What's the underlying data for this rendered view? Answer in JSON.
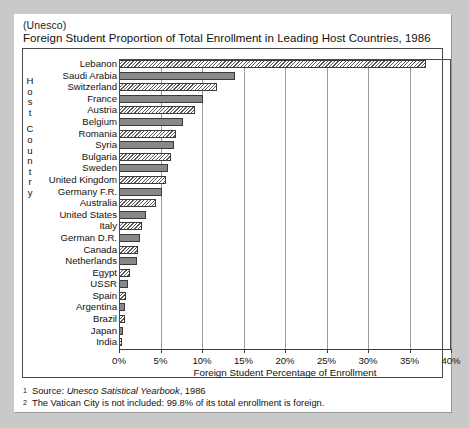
{
  "page": {
    "source_line": "(Unesco)",
    "title": "Foreign Student Proportion of Total Enrollment in Leading Host Countries, 1986"
  },
  "axis": {
    "y_label_letters": [
      "H",
      "o",
      "s",
      "t",
      "C",
      "o",
      "u",
      "n",
      "t",
      "r",
      "y"
    ],
    "y_label_text": "Host Country",
    "x_title": "Foreign Student Percentage of Enrollment",
    "x_ticks": [
      "0%",
      "5%",
      "10%",
      "15%",
      "20%",
      "25%",
      "30%",
      "35%",
      "40%"
    ]
  },
  "footnotes": [
    {
      "marker": "1",
      "prefix": "Source: ",
      "italic": "Unesco Satistical Yearbook",
      "suffix": ", 1986"
    },
    {
      "marker": "2",
      "prefix": "The Vatican City is not included:  99.8% of its total enrollment is foreign.",
      "italic": "",
      "suffix": ""
    }
  ],
  "chart_data": {
    "type": "bar",
    "orientation": "horizontal",
    "title": "Foreign Student Proportion of Total Enrollment in Leading Host Countries, 1986",
    "subtitle": "(Unesco)",
    "xlabel": "Foreign Student Percentage of Enrollment",
    "ylabel": "Host Country",
    "xlim": [
      0,
      40
    ],
    "xtick_step": 5,
    "grid": true,
    "legend": "none",
    "units": "percent",
    "categories": [
      "Lebanon",
      "Saudi Arabia",
      "Switzerland",
      "France",
      "Austria",
      "Belgium",
      "Romania",
      "Syria",
      "Bulgaria",
      "Sweden",
      "United Kingdom",
      "Germany F.R.",
      "Australia",
      "United States",
      "Italy",
      "German D.R.",
      "Canada",
      "Netherlands",
      "Egypt",
      "USSR",
      "Spain",
      "Argentina",
      "Brazil",
      "Japan",
      "India"
    ],
    "values": [
      37.0,
      14.0,
      11.8,
      10.1,
      9.2,
      7.7,
      6.9,
      6.6,
      6.3,
      5.9,
      5.7,
      5.2,
      4.4,
      3.2,
      2.8,
      2.5,
      2.3,
      2.2,
      1.3,
      1.1,
      0.9,
      0.7,
      0.7,
      0.5,
      0.1
    ],
    "fills": [
      "hatch",
      "solid",
      "hatch",
      "solid",
      "hatch",
      "solid",
      "hatch",
      "solid",
      "hatch",
      "solid",
      "hatch",
      "solid",
      "hatch",
      "solid",
      "hatch",
      "solid",
      "hatch",
      "solid",
      "hatch",
      "solid",
      "hatch",
      "solid",
      "hatch",
      "solid",
      "hatch"
    ]
  },
  "colors": {
    "page_background": "#c9c9c9",
    "card_background": "#ffffff",
    "frame": "#4a4a4a",
    "bar_solid": "#888888",
    "bar_hatch_line": "#5a5a5a",
    "gridline": "#9a9a9a",
    "text": "#111111"
  }
}
